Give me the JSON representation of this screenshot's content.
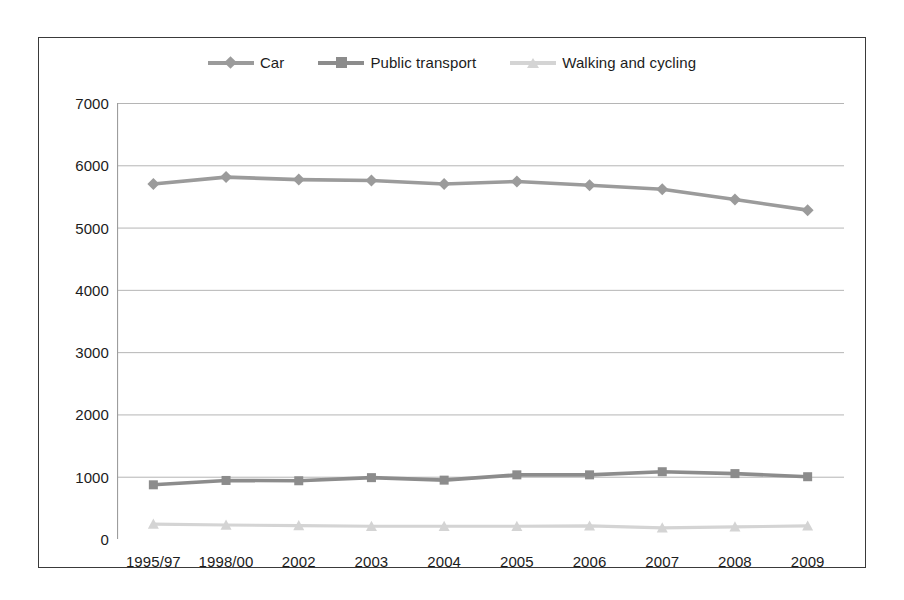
{
  "chart_data": {
    "type": "line",
    "title": "",
    "xlabel": "",
    "ylabel": "",
    "categories": [
      "1995/97",
      "1998/00",
      "2002",
      "2003",
      "2004",
      "2005",
      "2006",
      "2007",
      "2008",
      "2009"
    ],
    "ylim": [
      0,
      7000
    ],
    "yticks": [
      0,
      1000,
      2000,
      3000,
      4000,
      5000,
      6000,
      7000
    ],
    "ytick_labels": [
      "0",
      "1000",
      "2000",
      "3000",
      "4000",
      "5000",
      "6000",
      "7000"
    ],
    "grid": true,
    "legend_position": "top",
    "series": [
      {
        "name": "Car",
        "color": "#9b9b9b",
        "marker": "diamond",
        "values": [
          5700,
          5810,
          5770,
          5755,
          5700,
          5740,
          5680,
          5615,
          5450,
          5280
        ]
      },
      {
        "name": "Public transport",
        "color": "#8c8c8c",
        "marker": "square",
        "values": [
          870,
          940,
          935,
          985,
          945,
          1030,
          1030,
          1080,
          1050,
          1000
        ]
      },
      {
        "name": "Walking and cycling",
        "color": "#d4d4d4",
        "marker": "triangle",
        "values": [
          240,
          225,
          215,
          205,
          205,
          205,
          210,
          180,
          195,
          210
        ]
      }
    ]
  },
  "legend": {
    "items": [
      {
        "label": "Car",
        "color": "#9b9b9b",
        "marker": "diamond"
      },
      {
        "label": "Public transport",
        "color": "#8c8c8c",
        "marker": "square"
      },
      {
        "label": "Walking and cycling",
        "color": "#d4d4d4",
        "marker": "triangle"
      }
    ]
  },
  "colors": {
    "frame_border": "#3a3a3a",
    "gridline": "#b5b5b5",
    "axis": "#9d9d9d",
    "text": "#1c1c1c",
    "background": "#ffffff"
  }
}
